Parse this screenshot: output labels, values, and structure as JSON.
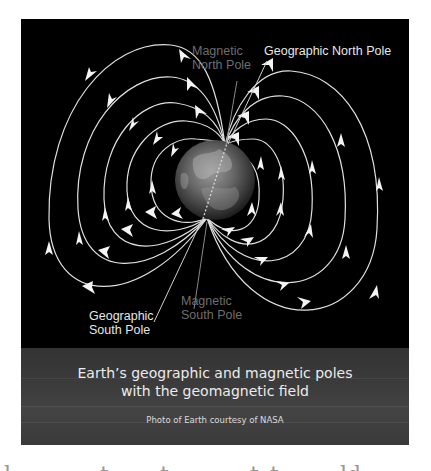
{
  "diagram": {
    "background_color": "#000000",
    "line_color": "#e8e8e8",
    "earth": {
      "cx": 194,
      "cy": 161,
      "r": 40
    },
    "north_pole_point": [
      204,
      126
    ],
    "south_pole_point": [
      186,
      199
    ],
    "labels": {
      "magnetic_north": {
        "line1": "Magnetic",
        "line2": "North Pole",
        "color": "#6e6e6e"
      },
      "geographic_north": {
        "line1": "Geographic North Pole",
        "color": "#e6e6e6"
      },
      "geographic_south": {
        "line1": "Geographic",
        "line2": "South Pole",
        "color": "#e6e6e6"
      },
      "magnetic_south": {
        "line1": "Magnetic",
        "line2": "South Pole",
        "color": "#6e6e6e"
      }
    },
    "field_line_count_left": 5,
    "field_line_count_right": 5
  },
  "caption": {
    "title_line1": "Earth’s geographic and magnetic poles",
    "title_line2": "with the geomagnetic field",
    "credit": "Photo of Earth courtesy of NASA",
    "background_color": "#3a3a3a"
  }
}
